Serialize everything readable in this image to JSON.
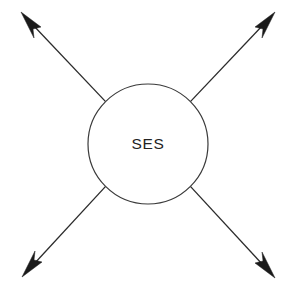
{
  "canvas": {
    "width": 291,
    "height": 287,
    "background_color": "#ffffff"
  },
  "node": {
    "label": "SES",
    "center_x": 148,
    "center_y": 144,
    "radius": 60,
    "fill_color": "#ffffff",
    "stroke_color": "#3a3a3a",
    "label_color": "#232323"
  },
  "arrows": [
    {
      "name": "arrow-top-left",
      "direction": "up-left",
      "start_x": 105.6,
      "start_y": 101.6,
      "tip_x": 24,
      "tip_y": 16,
      "line_end_x": 33,
      "line_end_y": 25,
      "stroke_color": "#2b2b2b",
      "head_color": "#1a1a1a"
    },
    {
      "name": "arrow-top-right",
      "direction": "up-right",
      "start_x": 190.4,
      "start_y": 101.6,
      "tip_x": 272,
      "tip_y": 16,
      "line_end_x": 263,
      "line_end_y": 25,
      "stroke_color": "#2b2b2b",
      "head_color": "#1a1a1a"
    },
    {
      "name": "arrow-bottom-left",
      "direction": "down-left",
      "start_x": 105.6,
      "start_y": 186.4,
      "tip_x": 25,
      "tip_y": 273,
      "line_end_x": 34,
      "line_end_y": 264,
      "stroke_color": "#2b2b2b",
      "head_color": "#1a1a1a"
    },
    {
      "name": "arrow-bottom-right",
      "direction": "down-right",
      "start_x": 190.4,
      "start_y": 186.4,
      "tip_x": 272,
      "tip_y": 274,
      "line_end_x": 263,
      "line_end_y": 265,
      "stroke_color": "#2b2b2b",
      "head_color": "#1a1a1a"
    }
  ]
}
